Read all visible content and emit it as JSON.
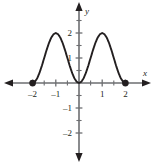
{
  "figure": {
    "name": "cartesian-plot",
    "background_color": "#ffffff",
    "curve_color": "#231f20",
    "axis_color": "#6d6e71",
    "text_color": "#231f20"
  },
  "axes": {
    "x_axis_label": "x",
    "y_axis_label": "y",
    "x_ticks": [
      {
        "value": -2,
        "label": "–2"
      },
      {
        "value": -1,
        "label": "–1"
      },
      {
        "value": 1,
        "label": "1"
      },
      {
        "value": 2,
        "label": "2"
      }
    ],
    "y_ticks": [
      {
        "value": 2,
        "label": "2"
      },
      {
        "value": 1,
        "label": "1"
      },
      {
        "value": -1,
        "label": "–1"
      },
      {
        "value": -2,
        "label": "–2"
      }
    ],
    "x_arrow_left": true,
    "x_arrow_right": true,
    "y_arrow_up": true,
    "y_arrow_down": true
  },
  "chart_data": {
    "type": "line",
    "title": "",
    "xlabel": "x",
    "ylabel": "y",
    "xlim": [
      -2.45,
      2.45
    ],
    "ylim": [
      -2.7,
      2.55
    ],
    "grid": false,
    "legend": "none",
    "xticks": [
      -2,
      -1,
      1,
      2
    ],
    "yticks": [
      -2,
      -1,
      1,
      2
    ],
    "series": [
      {
        "name": "f(x) = 2 sin^2(pi x / 2)",
        "domain": [
          -2,
          2
        ],
        "x": [
          -2.0,
          -1.9,
          -1.8,
          -1.7,
          -1.6,
          -1.5,
          -1.4,
          -1.3,
          -1.2,
          -1.1,
          -1.0,
          -0.9,
          -0.8,
          -0.7,
          -0.6,
          -0.5,
          -0.4,
          -0.3,
          -0.2,
          -0.1,
          0.0,
          0.1,
          0.2,
          0.3,
          0.4,
          0.5,
          0.6,
          0.7,
          0.8,
          0.9,
          1.0,
          1.1,
          1.2,
          1.3,
          1.4,
          1.5,
          1.6,
          1.7,
          1.8,
          1.9,
          2.0
        ],
        "y": [
          0.0,
          0.049,
          0.191,
          0.412,
          0.691,
          1.0,
          1.309,
          1.588,
          1.809,
          1.951,
          2.0,
          1.951,
          1.809,
          1.588,
          1.309,
          1.0,
          0.691,
          0.412,
          0.191,
          0.049,
          0.0,
          0.049,
          0.191,
          0.412,
          0.691,
          1.0,
          1.309,
          1.588,
          1.809,
          1.951,
          2.0,
          1.951,
          1.809,
          1.588,
          1.309,
          1.0,
          0.691,
          0.412,
          0.191,
          0.049,
          0.0
        ]
      }
    ],
    "endpoints": [
      {
        "x": -2,
        "y": 0,
        "style": "closed-dot"
      },
      {
        "x": 2,
        "y": 0,
        "style": "closed-dot"
      }
    ],
    "annotations": [
      {
        "text": "local maximum",
        "x": -1,
        "y": 2
      },
      {
        "text": "local maximum",
        "x": 1,
        "y": 2
      },
      {
        "text": "local minimum",
        "x": 0,
        "y": 0
      }
    ]
  }
}
